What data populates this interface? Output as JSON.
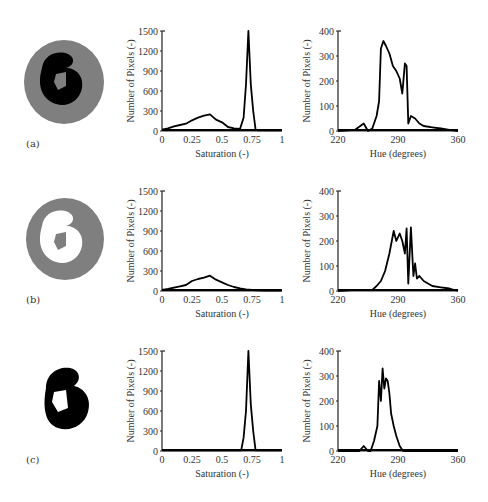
{
  "figure": {
    "panels": [
      {
        "label": "(a)",
        "cell_image": {
          "description": "segmented cell: gray cytoplasm with black nucleus",
          "cytoplasm_color": "#808080",
          "nucleus_color": "#000000"
        },
        "saturation_chart": {
          "xlabel": "Saturation (-)",
          "ylabel": "Number of Pixels (-)",
          "xticks": [
            "0",
            "0.25",
            "0.5",
            "0.75",
            "1"
          ],
          "yticks": [
            "0",
            "300",
            "600",
            "900",
            "1200",
            "1500"
          ]
        },
        "hue_chart": {
          "xlabel": "Hue (degrees)",
          "ylabel": "Number of Pixels (-)",
          "xticks": [
            "220",
            "290",
            "360"
          ],
          "yticks": [
            "0",
            "100",
            "200",
            "300",
            "400"
          ]
        }
      },
      {
        "label": "(b)",
        "cell_image": {
          "description": "cytoplasm region only (gray), nucleus removed (white)",
          "cytoplasm_color": "#808080",
          "nucleus_color": "#ffffff"
        },
        "saturation_chart": {
          "xlabel": "Saturation (-)",
          "ylabel": "Number of Pixels (-)",
          "xticks": [
            "0",
            "0.25",
            "0.5",
            "0.75",
            "1"
          ],
          "yticks": [
            "0",
            "300",
            "600",
            "900",
            "1200",
            "1500"
          ]
        },
        "hue_chart": {
          "xlabel": "Hue (degrees)",
          "ylabel": "Number of Pixels (-)",
          "xticks": [
            "220",
            "290",
            "360"
          ],
          "yticks": [
            "0",
            "100",
            "200",
            "300",
            "400"
          ]
        }
      },
      {
        "label": "(c)",
        "cell_image": {
          "description": "nucleus region only (black)",
          "cytoplasm_color": "#ffffff",
          "nucleus_color": "#000000"
        },
        "saturation_chart": {
          "xlabel": "Saturation (-)",
          "ylabel": "Number of Pixels (-)",
          "xticks": [
            "0",
            "0.25",
            "0.5",
            "0.75",
            "1"
          ],
          "yticks": [
            "0",
            "300",
            "600",
            "900",
            "1200",
            "1500"
          ]
        },
        "hue_chart": {
          "xlabel": "Hue (degrees)",
          "ylabel": "Number of Pixels (-)",
          "xticks": [
            "220",
            "290",
            "360"
          ],
          "yticks": [
            "0",
            "100",
            "200",
            "300",
            "400"
          ]
        }
      }
    ]
  },
  "chart_data": [
    {
      "type": "line",
      "panel": "(a)",
      "title": "",
      "xlabel": "Saturation (-)",
      "ylabel": "Number of Pixels (-)",
      "xlim": [
        0,
        1
      ],
      "ylim": [
        0,
        1500
      ],
      "grid": false,
      "x": [
        0,
        0.05,
        0.1,
        0.15,
        0.2,
        0.25,
        0.3,
        0.35,
        0.4,
        0.45,
        0.5,
        0.55,
        0.6,
        0.65,
        0.68,
        0.7,
        0.72,
        0.74,
        0.76,
        0.78,
        0.8,
        0.85,
        0.9,
        0.95,
        1
      ],
      "series": [
        {
          "name": "histogram",
          "values": [
            20,
            40,
            70,
            90,
            110,
            160,
            200,
            230,
            250,
            170,
            130,
            60,
            40,
            30,
            200,
            700,
            1500,
            700,
            300,
            20,
            10,
            10,
            10,
            10,
            10
          ]
        }
      ]
    },
    {
      "type": "line",
      "panel": "(a)",
      "title": "",
      "xlabel": "Hue (degrees)",
      "ylabel": "Number of Pixels (-)",
      "xlim": [
        220,
        360
      ],
      "ylim": [
        0,
        400
      ],
      "grid": false,
      "x": [
        220,
        240,
        250,
        255,
        260,
        265,
        268,
        270,
        273,
        276,
        280,
        284,
        288,
        292,
        295,
        298,
        300,
        302,
        305,
        310,
        315,
        320,
        330,
        340,
        350,
        360
      ],
      "series": [
        {
          "name": "histogram",
          "values": [
            0,
            5,
            30,
            0,
            10,
            60,
            120,
            330,
            360,
            340,
            310,
            260,
            240,
            210,
            150,
            270,
            260,
            30,
            60,
            50,
            30,
            20,
            15,
            10,
            5,
            0
          ]
        }
      ]
    },
    {
      "type": "line",
      "panel": "(b)",
      "title": "",
      "xlabel": "Saturation (-)",
      "ylabel": "Number of Pixels (-)",
      "xlim": [
        0,
        1
      ],
      "ylim": [
        0,
        1500
      ],
      "grid": false,
      "x": [
        0,
        0.05,
        0.1,
        0.15,
        0.2,
        0.25,
        0.3,
        0.35,
        0.4,
        0.45,
        0.5,
        0.55,
        0.6,
        0.65,
        0.7,
        0.75,
        0.8,
        0.85,
        0.9,
        0.95,
        1
      ],
      "series": [
        {
          "name": "histogram",
          "values": [
            15,
            30,
            50,
            70,
            90,
            150,
            180,
            200,
            230,
            170,
            130,
            90,
            60,
            40,
            25,
            15,
            10,
            8,
            5,
            5,
            5
          ]
        }
      ]
    },
    {
      "type": "line",
      "panel": "(b)",
      "title": "",
      "xlabel": "Hue (degrees)",
      "ylabel": "Number of Pixels (-)",
      "xlim": [
        220,
        360
      ],
      "ylim": [
        0,
        400
      ],
      "grid": false,
      "x": [
        220,
        240,
        250,
        260,
        265,
        270,
        275,
        280,
        285,
        288,
        292,
        295,
        298,
        300,
        302,
        305,
        308,
        310,
        312,
        315,
        320,
        330,
        340,
        350,
        360
      ],
      "series": [
        {
          "name": "histogram",
          "values": [
            0,
            5,
            5,
            5,
            20,
            40,
            80,
            150,
            240,
            200,
            230,
            200,
            150,
            250,
            30,
            255,
            60,
            110,
            50,
            60,
            40,
            20,
            15,
            10,
            0
          ]
        }
      ]
    },
    {
      "type": "line",
      "panel": "(c)",
      "title": "",
      "xlabel": "Saturation (-)",
      "ylabel": "Number of Pixels (-)",
      "xlim": [
        0,
        1
      ],
      "ylim": [
        0,
        1500
      ],
      "grid": false,
      "x": [
        0,
        0.2,
        0.4,
        0.6,
        0.66,
        0.68,
        0.7,
        0.72,
        0.74,
        0.76,
        0.78,
        0.8,
        1
      ],
      "series": [
        {
          "name": "histogram",
          "values": [
            10,
            10,
            10,
            10,
            10,
            200,
            600,
            1500,
            700,
            300,
            10,
            10,
            10
          ]
        }
      ]
    },
    {
      "type": "line",
      "panel": "(c)",
      "title": "",
      "xlabel": "Hue (degrees)",
      "ylabel": "Number of Pixels (-)",
      "xlim": [
        220,
        360
      ],
      "ylim": [
        0,
        400
      ],
      "grid": false,
      "x": [
        220,
        245,
        250,
        255,
        258,
        262,
        266,
        268,
        270,
        272,
        274,
        276,
        278,
        280,
        282,
        285,
        288,
        292,
        296,
        300,
        360
      ],
      "series": [
        {
          "name": "histogram",
          "values": [
            0,
            0,
            20,
            0,
            0,
            40,
            100,
            280,
            200,
            330,
            250,
            290,
            280,
            230,
            150,
            100,
            60,
            20,
            0,
            0,
            0
          ]
        }
      ]
    }
  ]
}
